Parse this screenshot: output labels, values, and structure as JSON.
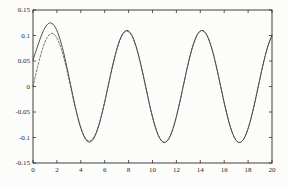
{
  "figure": {
    "background": "#fcfcfa",
    "axis_color": "#2e2e2e",
    "label_color": "#1f1f1f",
    "tick_length": 3
  },
  "chart_data": {
    "type": "line",
    "title": "",
    "xlabel": "",
    "ylabel": "",
    "xlim": [
      0,
      20
    ],
    "ylim": [
      -0.15,
      0.15
    ],
    "grid": false,
    "box": true,
    "legend": null,
    "xticks": [
      0,
      2,
      4,
      6,
      8,
      10,
      12,
      14,
      16,
      18,
      20
    ],
    "xtick_labels": [
      "0",
      "2",
      "4",
      "6",
      "8",
      "10",
      "12",
      "14",
      "16",
      "18",
      "20"
    ],
    "yticks": [
      -0.15,
      -0.1,
      -0.05,
      0,
      0.05,
      0.1,
      0.15
    ],
    "ytick_labels": [
      "-0.15",
      "-0.1",
      "-0.05",
      "0",
      "0.05",
      "0.1",
      "0.15"
    ],
    "x": [
      0,
      0.393,
      0.785,
      1.178,
      1.571,
      1.963,
      2.356,
      2.749,
      3.142,
      3.534,
      3.927,
      4.32,
      4.712,
      5.105,
      5.498,
      5.89,
      6.283,
      6.676,
      7.069,
      7.461,
      7.854,
      8.247,
      8.639,
      9.032,
      9.425,
      9.817,
      10.21,
      10.603,
      10.996,
      11.388,
      11.781,
      12.174,
      12.566,
      12.959,
      13.352,
      13.744,
      14.137,
      14.53,
      14.923,
      15.315,
      15.708,
      16.101,
      16.493,
      16.886,
      17.279,
      17.671,
      18.064,
      18.457,
      18.85,
      19.242,
      19.635,
      20
    ],
    "series": [
      {
        "name": "response-solid",
        "line_style": "solid",
        "color": "#3a3a3a",
        "width": 0.9,
        "dash": "",
        "values": [
          0.052,
          0.0796,
          0.1048,
          0.1211,
          0.124,
          0.1117,
          0.0851,
          0.0474,
          0.0038,
          -0.0394,
          -0.0758,
          -0.1002,
          -0.109,
          -0.1009,
          -0.0773,
          -0.0417,
          0.0003,
          0.0421,
          0.0778,
          0.1016,
          0.11,
          0.1016,
          0.0778,
          0.0421,
          0.0,
          -0.0421,
          -0.0778,
          -0.1016,
          -0.11,
          -0.1016,
          -0.0778,
          -0.0421,
          0.0,
          0.0421,
          0.0778,
          0.1016,
          0.11,
          0.1016,
          0.0778,
          0.0421,
          0.0,
          -0.0421,
          -0.0778,
          -0.1016,
          -0.11,
          -0.1016,
          -0.0778,
          -0.0421,
          0.0,
          0.0421,
          0.0778,
          0.1004
        ]
      },
      {
        "name": "response-dashed",
        "line_style": "dashed",
        "color": "#4a4a4a",
        "width": 0.8,
        "dash": "2 1.8",
        "values": [
          0.0,
          0.0393,
          0.073,
          0.0958,
          0.1042,
          0.0966,
          0.0742,
          0.0403,
          0.0,
          -0.0406,
          -0.0752,
          -0.0985,
          -0.1069,
          -0.099,
          -0.0759,
          -0.0411,
          0.0,
          0.0413,
          0.0764,
          0.1,
          0.1083,
          0.1002,
          0.0768,
          0.0416,
          0.0,
          -0.0417,
          -0.0771,
          -0.1007,
          -0.1091,
          -0.1009,
          -0.0772,
          -0.0418,
          0.0,
          0.0419,
          0.0774,
          0.1011,
          0.1095,
          0.1012,
          0.0775,
          0.0419,
          0.0,
          -0.0419,
          -0.0775,
          -0.1013,
          -0.1096,
          -0.1013,
          -0.0775,
          -0.042,
          0.0,
          0.042,
          0.0776,
          0.1001
        ]
      }
    ]
  },
  "layout_px": {
    "width": 288,
    "height": 186,
    "plot_left": 33,
    "plot_top": 10,
    "plot_right": 272,
    "plot_bottom": 163
  }
}
